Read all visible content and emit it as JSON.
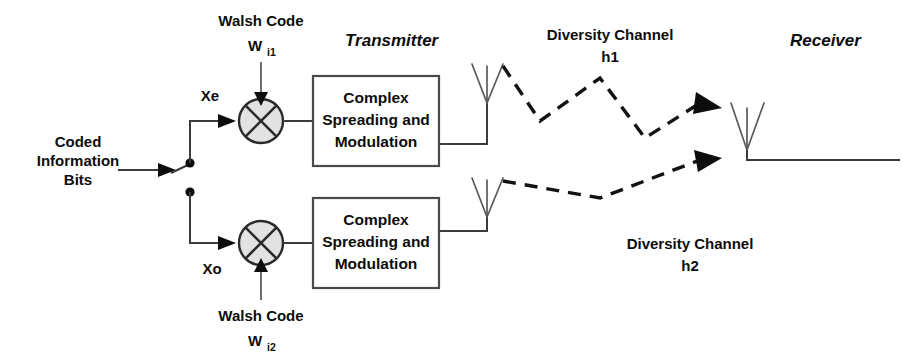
{
  "diagram": {
    "title_transmitter": "Transmitter",
    "title_receiver": "Receiver",
    "input_label_line1": "Coded",
    "input_label_line2": "Information",
    "input_label_line3": "Bits",
    "branch_upper_signal": "Xe",
    "branch_lower_signal": "Xo",
    "walsh_upper_text": "Walsh Code",
    "walsh_upper_symbol": "W",
    "walsh_upper_subscript": "i1",
    "walsh_lower_text": "Walsh Code",
    "walsh_lower_symbol": "W",
    "walsh_lower_subscript": "i2",
    "block_upper_line1": "Complex",
    "block_upper_line2": "Spreading and",
    "block_upper_line3": "Modulation",
    "block_lower_line1": "Complex",
    "block_lower_line2": "Spreading and",
    "block_lower_line3": "Modulation",
    "channel_upper_name": "Diversity Channel",
    "channel_upper_gain": "h1",
    "channel_lower_name": "Diversity Channel",
    "channel_lower_gain": "h2",
    "colors": {
      "ink": "#0d0d0d",
      "wire": "#3b3b3b",
      "antenna": "#5a5a5a",
      "mixer_fill": "#e2e2e2",
      "background": "#ffffff"
    }
  }
}
